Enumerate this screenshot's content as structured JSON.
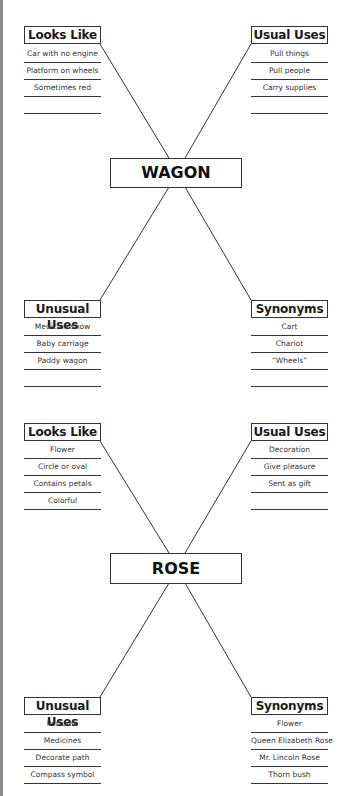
{
  "diagrams": [
    {
      "center": "WAGON",
      "looks_like": {
        "title": "Looks Like",
        "items": [
          "Car with no engine",
          "Platform on wheels",
          "Sometimes red",
          ""
        ]
      },
      "usual_uses": {
        "title": "Usual Uses",
        "items": [
          "Pull things",
          "Pull people",
          "Carry supplies",
          ""
        ]
      },
      "unusual_uses": {
        "title": "Unusual Uses",
        "items": [
          "Medicine show",
          "Baby carriage",
          "Paddy wagon",
          ""
        ]
      },
      "synonyms": {
        "title": "Synonyms",
        "items": [
          "Cart",
          "Chariot",
          "“Wheels”",
          ""
        ]
      }
    },
    {
      "center": "ROSE",
      "looks_like": {
        "title": "Looks Like",
        "items": [
          "Flower",
          "Circle or oval",
          "Contains petals",
          "Colorful"
        ]
      },
      "usual_uses": {
        "title": "Usual Uses",
        "items": [
          "Decoration",
          "Give pleasure",
          "Sent as gift",
          ""
        ]
      },
      "unusual_uses": {
        "title": "Unusual Uses",
        "items": [
          "Perfume",
          "Medicines",
          "Decorate path",
          "Compass symbol"
        ]
      },
      "synonyms": {
        "title": "Synonyms",
        "items": [
          "Flower",
          "Queen Elizabeth Rose",
          "Mr. Lincoln Rose",
          "Thorn bush"
        ]
      }
    }
  ]
}
